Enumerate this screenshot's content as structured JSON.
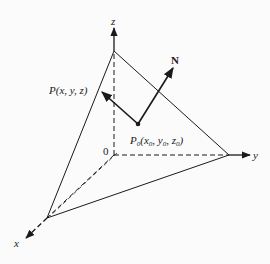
{
  "diagram": {
    "type": "3d-plane-normal-vector",
    "labels": {
      "z_axis": "z",
      "y_axis": "y",
      "x_axis": "x",
      "origin": "0",
      "normal": "N",
      "point_p": "P(x, y, z)",
      "point_p0_main": "P",
      "point_p0_sub": "0",
      "point_p0_coords_open": "(x",
      "point_p0_x_sub": "0",
      "point_p0_comma1": ", y",
      "point_p0_y_sub": "0",
      "point_p0_comma2": ", z",
      "point_p0_z_sub": "0",
      "point_p0_close": ")"
    },
    "colors": {
      "ink": "#1a1a1a",
      "background": "#fbfbfb"
    }
  }
}
